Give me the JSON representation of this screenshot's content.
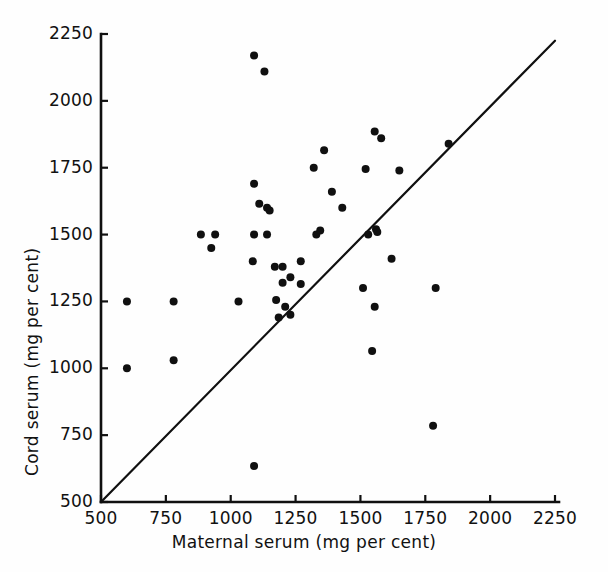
{
  "chart_data": {
    "type": "scatter",
    "title": "",
    "xlabel": "Maternal serum (mg per cent)",
    "ylabel": "Cord serum (mg per cent)",
    "xlim": [
      500,
      2250
    ],
    "ylim": [
      500,
      2250
    ],
    "xticks": [
      500,
      750,
      1000,
      1250,
      1500,
      1750,
      2000,
      2250
    ],
    "yticks": [
      500,
      750,
      1000,
      1250,
      1500,
      1750,
      2000,
      2250
    ],
    "xticklabels": [
      "500",
      "750",
      "1000",
      "1250",
      "1500",
      "1750",
      "2000",
      "2250"
    ],
    "yticklabels": [
      "500",
      "750",
      "1000",
      "1250",
      "1500",
      "1750",
      "2000",
      "2250"
    ],
    "grid": false,
    "legend": null,
    "marker": "filled-circle",
    "marker_color": "#101010",
    "marker_size_px": 8,
    "axis_color": "#101010",
    "background": "#ffffff",
    "reference_line": {
      "label": "line of identity",
      "from": [
        500,
        500
      ],
      "to": [
        2250,
        2225
      ],
      "color": "#101010",
      "width_px": 2.2
    },
    "points": [
      {
        "x": 600,
        "y": 1250
      },
      {
        "x": 600,
        "y": 1000
      },
      {
        "x": 780,
        "y": 1250
      },
      {
        "x": 780,
        "y": 1030
      },
      {
        "x": 885,
        "y": 1500
      },
      {
        "x": 940,
        "y": 1500
      },
      {
        "x": 925,
        "y": 1450
      },
      {
        "x": 1030,
        "y": 1250
      },
      {
        "x": 1090,
        "y": 635
      },
      {
        "x": 1090,
        "y": 2170
      },
      {
        "x": 1130,
        "y": 2110
      },
      {
        "x": 1090,
        "y": 1690
      },
      {
        "x": 1110,
        "y": 1615
      },
      {
        "x": 1140,
        "y": 1600
      },
      {
        "x": 1150,
        "y": 1590
      },
      {
        "x": 1090,
        "y": 1500
      },
      {
        "x": 1140,
        "y": 1500
      },
      {
        "x": 1085,
        "y": 1400
      },
      {
        "x": 1170,
        "y": 1380
      },
      {
        "x": 1200,
        "y": 1380
      },
      {
        "x": 1200,
        "y": 1320
      },
      {
        "x": 1230,
        "y": 1340
      },
      {
        "x": 1175,
        "y": 1255
      },
      {
        "x": 1210,
        "y": 1230
      },
      {
        "x": 1185,
        "y": 1190
      },
      {
        "x": 1230,
        "y": 1200
      },
      {
        "x": 1270,
        "y": 1315
      },
      {
        "x": 1270,
        "y": 1400
      },
      {
        "x": 1320,
        "y": 1750
      },
      {
        "x": 1330,
        "y": 1500
      },
      {
        "x": 1360,
        "y": 1815
      },
      {
        "x": 1345,
        "y": 1515
      },
      {
        "x": 1390,
        "y": 1660
      },
      {
        "x": 1430,
        "y": 1600
      },
      {
        "x": 1510,
        "y": 1300
      },
      {
        "x": 1520,
        "y": 1745
      },
      {
        "x": 1530,
        "y": 1500
      },
      {
        "x": 1545,
        "y": 1065
      },
      {
        "x": 1555,
        "y": 1885
      },
      {
        "x": 1580,
        "y": 1860
      },
      {
        "x": 1560,
        "y": 1520
      },
      {
        "x": 1565,
        "y": 1510
      },
      {
        "x": 1555,
        "y": 1230
      },
      {
        "x": 1620,
        "y": 1410
      },
      {
        "x": 1650,
        "y": 1740
      },
      {
        "x": 1780,
        "y": 785
      },
      {
        "x": 1790,
        "y": 1300
      },
      {
        "x": 1840,
        "y": 1840
      }
    ]
  },
  "figure": {
    "axis_title_x": "Maternal serum (mg per cent)",
    "axis_title_y": "Cord serum (mg per cent)"
  }
}
